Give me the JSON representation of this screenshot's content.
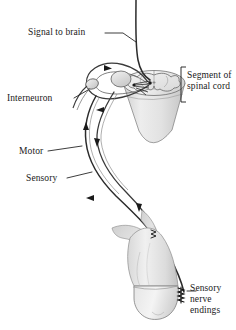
{
  "figure": {
    "background_color": "#ffffff",
    "ink_color": "#1a1a1a",
    "tissue_fill_light": "#ebebeb",
    "tissue_fill_mid": "#d6d6d6",
    "tissue_fill_dark": "#bdbdbd",
    "nerve_color": "#2b2b2b"
  },
  "labels": {
    "signal_to_brain": "Signal to brain",
    "interneuron": "Interneuron",
    "motor": "Motor",
    "sensory": "Sensory",
    "segment_of_spinal_cord": "Segment of\nspinal cord",
    "sensory_nerve_endings": "Sensory\nnerve\nendings"
  },
  "structures": [
    {
      "name": "ascending-nerve-to-brain",
      "kind": "nerve-fiber"
    },
    {
      "name": "spinal-cord-segment",
      "kind": "organ"
    },
    {
      "name": "gray-matter-butterfly",
      "kind": "tissue"
    },
    {
      "name": "dorsal-root-ganglion",
      "kind": "ganglion"
    },
    {
      "name": "interneuron-loop",
      "kind": "neuron"
    },
    {
      "name": "motor-nerve-fiber",
      "kind": "nerve-fiber"
    },
    {
      "name": "sensory-nerve-fiber",
      "kind": "nerve-fiber"
    },
    {
      "name": "finger",
      "kind": "limb"
    },
    {
      "name": "sensory-nerve-endings",
      "kind": "receptor"
    }
  ],
  "flow_arrows": [
    {
      "name": "arrow-interneuron-top",
      "direction": "right",
      "on": "sensory-fiber"
    },
    {
      "name": "arrow-interneuron-bottom",
      "direction": "left",
      "on": "motor-fiber"
    },
    {
      "name": "arrow-motor-descending-upper",
      "direction": "up",
      "on": "sensory-fiber"
    },
    {
      "name": "arrow-motor-descending-lower",
      "direction": "down",
      "on": "motor-fiber"
    },
    {
      "name": "arrow-sensory-ascending",
      "direction": "left-up",
      "on": "sensory-fiber"
    },
    {
      "name": "arrow-motor-to-finger",
      "direction": "down",
      "on": "motor-fiber"
    },
    {
      "name": "arrow-in-finger",
      "direction": "down",
      "on": "motor-fiber"
    }
  ]
}
